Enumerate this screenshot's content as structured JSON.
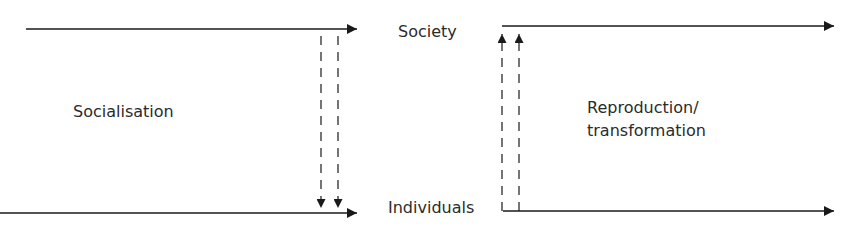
{
  "diagram": {
    "labels": {
      "society": "Society",
      "individuals": "Individuals",
      "socialisation": "Socialisation",
      "reproduction_line1": "Reproduction/",
      "reproduction_line2": "transformation"
    },
    "colors": {
      "line": "#1a1a1a",
      "text": "#2b2b2b",
      "background": "#ffffff"
    },
    "arrows": [
      {
        "name": "society-timeline-left",
        "direction": "right",
        "style": "solid"
      },
      {
        "name": "individuals-timeline-left",
        "direction": "right",
        "style": "solid"
      },
      {
        "name": "socialisation-arrow-1",
        "direction": "down",
        "style": "dashed"
      },
      {
        "name": "socialisation-arrow-2",
        "direction": "down",
        "style": "dashed"
      },
      {
        "name": "reproduction-arrow-1",
        "direction": "up",
        "style": "dashed"
      },
      {
        "name": "reproduction-arrow-2",
        "direction": "up",
        "style": "dashed"
      },
      {
        "name": "society-timeline-right",
        "direction": "right",
        "style": "solid"
      },
      {
        "name": "individuals-timeline-right",
        "direction": "right",
        "style": "solid"
      }
    ]
  }
}
